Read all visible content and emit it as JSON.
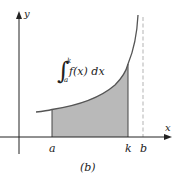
{
  "figure": {
    "caption": "(b)",
    "axes": {
      "x_label": "x",
      "y_label": "y"
    },
    "tick_labels": {
      "a": "a",
      "k": "k",
      "b": "b"
    },
    "integral": {
      "symbol": "∫",
      "upper": "k",
      "lower": "a",
      "integrand": "f(x) dx"
    },
    "colors": {
      "shade": "#b9b9b9",
      "curve": "#555555",
      "axis": "#222222",
      "asymptote": "#aaaaaa"
    }
  }
}
